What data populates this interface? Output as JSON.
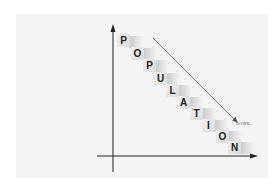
{
  "diagram": {
    "word": "POPULATION",
    "letters": [
      "P",
      "O",
      "P",
      "U",
      "L",
      "A",
      "T",
      "I",
      "O",
      "N"
    ],
    "arrow_label": "DOWN...",
    "colors": {
      "background": "#ffffff",
      "panel": "#f4f4f4",
      "axis": "#222222",
      "tile": "#e6e6e6",
      "arrow": "#555555"
    }
  }
}
